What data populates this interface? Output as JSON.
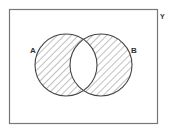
{
  "diagram": {
    "type": "venn",
    "universal_set": {
      "label": "Y",
      "border_color": "#777777"
    },
    "sets": [
      {
        "label": "A",
        "shaded": true
      },
      {
        "label": "B",
        "shaded": true
      }
    ],
    "intersection": {
      "sets": [
        "A",
        "B"
      ],
      "shaded": false
    },
    "shaded_region": "A Δ B (symmetric difference)",
    "hatch": {
      "direction": "diagonal-top-left-to-bottom-right",
      "color": "#8a8a8a",
      "spacing_px": 5
    },
    "outline_color": "#444444"
  }
}
